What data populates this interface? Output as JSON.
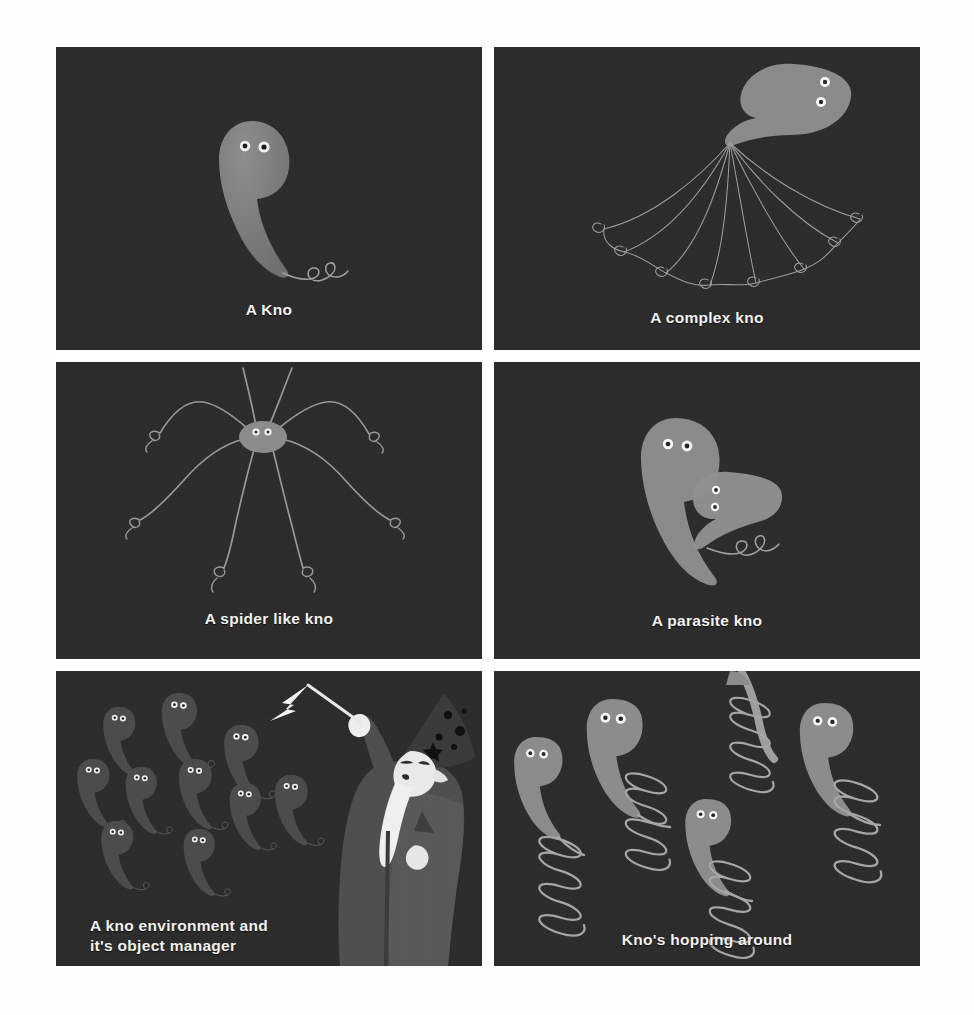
{
  "page": {
    "background": "#fdfdfd",
    "panel_background": "#2b2b2b",
    "caption_color": "#f2f2f2",
    "kno_body_color": "#808080",
    "kno_body_dim_color": "#4a4a4a",
    "line_color": "#9a9a9a",
    "eye_white": "#f5f5f5",
    "eye_pupil": "#1c1c1c",
    "wizard_robe_color": "#4f4f4f",
    "wizard_hat_color": "#3a3a3a",
    "wizard_beard_color": "#efefef"
  },
  "panels": [
    {
      "id": "a-kno",
      "caption": "A Kno",
      "subject": "single-kno",
      "description": "One teardrop shaped kno with two eyes and a curly tail"
    },
    {
      "id": "a-complex-kno",
      "caption": "A complex kno",
      "subject": "complex-kno",
      "description": "Kno head at upper right with eight thin tentacles fanning down and left, each ending in a curl",
      "tentacle_count": 8
    },
    {
      "id": "a-spider-like-kno",
      "caption": "A spider like kno",
      "subject": "spider-kno",
      "description": "Small oval body with two eyes and eight long bent legs each ending in a curl",
      "leg_count": 8
    },
    {
      "id": "a-parasite-kno",
      "caption": "A parasite kno",
      "subject": "parasite-kno",
      "description": "A large kno with a smaller mirrored kno nestled in its curve",
      "kno_count": 2
    },
    {
      "id": "a-kno-environment-and-its-object-manager",
      "caption_lines": [
        "A kno environment and",
        "it's object manager"
      ],
      "subject": "wizard-and-knos",
      "description": "A wizard in a pointed starry hat raising a wand with a lightning bolt, surrounded by ten dim knos",
      "kno_count": 10
    },
    {
      "id": "knos-hopping-around",
      "caption": "Kno's hopping around",
      "subject": "knos-on-springs",
      "description": "Five knos whose tails become coil springs",
      "kno_count": 5
    }
  ]
}
